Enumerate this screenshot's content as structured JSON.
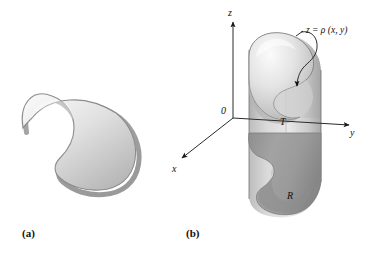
{
  "figure": {
    "panels": [
      {
        "id": "a",
        "caption": "(a)",
        "description": "flat bean-shaped plane region with drop shadow"
      },
      {
        "id": "b",
        "caption": "(b)",
        "description": "three-dimensional cylindrical solid over region R capped by surface T"
      }
    ],
    "axes": {
      "origin_label": "0",
      "z_label": "z",
      "y_label": "y",
      "x_label": "x"
    },
    "annotations": {
      "surface_equation": "z = ρ (x, y)",
      "top_region_label": "T",
      "base_region_label": "R"
    },
    "colors": {
      "blob_light": "#f2f2f2",
      "blob_mid": "#c9c9c9",
      "blob_edge": "#9a9a9a",
      "outline": "#6e6e6e",
      "solid_side_light": "#d7d7d7",
      "solid_side_dark": "#a8a8a8",
      "base_region": "#9f9f9f",
      "base_region_dark": "#8a8a8a",
      "axis": "#2a2a2a",
      "text": "#111111",
      "background": "#ffffff"
    }
  }
}
